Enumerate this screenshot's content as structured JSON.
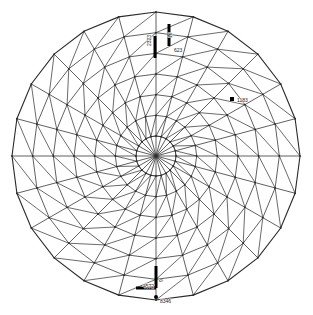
{
  "figure": {
    "name": "circular-fea-mesh",
    "background_color": "#ffffff",
    "mesh_color": "#2b2b2b",
    "marker_color": "#000000",
    "label_color": "#1a1a1a"
  },
  "geometry": {
    "center_x": 156,
    "center_y": 156,
    "radius": 144,
    "ring_count": 7,
    "spoke_count": 24,
    "inner_hub_radius": 20
  },
  "annotations": {
    "node_labels": [
      {
        "id": "label-2323",
        "text": "2323",
        "x": 151,
        "y": 46,
        "rotation": -90
      },
      {
        "id": "label-16",
        "text": "16",
        "x": 172,
        "y": 38,
        "rotation": -90
      },
      {
        "id": "label-623",
        "text": "623",
        "x": 174,
        "y": 52,
        "rotation": 0
      },
      {
        "id": "label-1183",
        "text": "1183",
        "x": 237,
        "y": 102,
        "rotation": 0
      },
      {
        "id": "label-4572",
        "text": "4572",
        "x": 143,
        "y": 288,
        "rotation": 0
      },
      {
        "id": "label-8346",
        "text": "8346",
        "x": 160,
        "y": 303,
        "rotation": 0
      },
      {
        "id": "label-9",
        "text": "9",
        "x": 163,
        "y": 282,
        "rotation": -90
      }
    ],
    "point_markers": [
      {
        "id": "marker-1183",
        "shape": "square",
        "x": 232,
        "y": 99,
        "size": 4
      },
      {
        "id": "marker-8346",
        "shape": "circle",
        "x": 156,
        "y": 297,
        "size": 4
      }
    ],
    "boundary_markers": [
      {
        "id": "bc-top-left",
        "shape": "vertical-bar",
        "x": 155,
        "y": 36,
        "length": 22,
        "thickness": 3
      },
      {
        "id": "bc-top-right",
        "shape": "vertical-bar",
        "x": 169,
        "y": 24,
        "length": 22,
        "thickness": 3
      },
      {
        "id": "bc-bottom-l",
        "shape": "l-bracket",
        "x": 156,
        "y": 266,
        "arm_v": 22,
        "arm_h": 20,
        "thickness": 3
      }
    ]
  }
}
